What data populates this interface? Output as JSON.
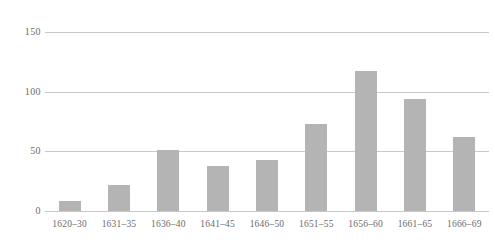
{
  "chart_data": {
    "type": "bar",
    "title": "",
    "subtitle": "",
    "xlabel": "",
    "ylabel": "",
    "categories": [
      "1620–30",
      "1631–35",
      "1636–40",
      "1641–45",
      "1646–50",
      "1651–55",
      "1656–60",
      "1661–65",
      "1666–69"
    ],
    "values": [
      8,
      22,
      51,
      38,
      43,
      73,
      117,
      94,
      62
    ],
    "ylim": [
      0,
      150
    ],
    "yticks": [
      0,
      50,
      100,
      150
    ],
    "ytick_labels": [
      "0",
      "50",
      "100",
      "150"
    ],
    "grid": true,
    "legend": false,
    "legend_position": "none",
    "bar_color": "#b4b4b4",
    "gridline_color": "#c8c8c8",
    "text_color": "#6b6b6b",
    "background_color": "#ffffff"
  }
}
